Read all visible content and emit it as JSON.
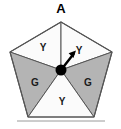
{
  "figure": {
    "name": "pentagon-sector-diagram",
    "background_color": "#ffffff",
    "apex_label": "A",
    "center_dot_color": "#000000",
    "outline_color": "#555555",
    "gray_fill": "#b4b4b4",
    "white_fill": "#fbfbfb",
    "bottom_rule_color": "#9a9a9a"
  },
  "sectors": [
    {
      "id": "upper-left",
      "label": "Y",
      "fill": "#fbfbfb",
      "label_x": 43,
      "label_y": 48
    },
    {
      "id": "upper-right",
      "label": "Y",
      "fill": "#fbfbfb",
      "label_x": 79,
      "label_y": 51
    },
    {
      "id": "left",
      "label": "G",
      "fill": "#b4b4b4",
      "label_x": 35,
      "label_y": 83
    },
    {
      "id": "right",
      "label": "G",
      "fill": "#b4b4b4",
      "label_x": 88,
      "label_y": 83
    },
    {
      "id": "bottom",
      "label": "Y",
      "fill": "#fbfbfb",
      "label_x": 62,
      "label_y": 102
    }
  ],
  "geometry": {
    "vertices": {
      "apex": {
        "x": 61,
        "y": 22
      },
      "right_upper": {
        "x": 112,
        "y": 52
      },
      "right_lower": {
        "x": 94,
        "y": 117
      },
      "left_lower": {
        "x": 28,
        "y": 117
      },
      "left_upper": {
        "x": 10,
        "y": 52
      }
    },
    "center": {
      "x": 61,
      "y": 70
    },
    "center_dot_radius": 5.5
  },
  "arrow": {
    "name": "direction-arrow",
    "from_x": 61,
    "from_y": 70,
    "to_x": 75,
    "to_y": 52,
    "color": "#000000"
  }
}
